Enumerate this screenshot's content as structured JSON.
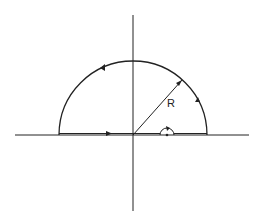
{
  "diagram": {
    "type": "contour-integration",
    "labels": {
      "radius": "R"
    },
    "colors": {
      "stroke": "#222222",
      "background": "#ffffff"
    }
  }
}
